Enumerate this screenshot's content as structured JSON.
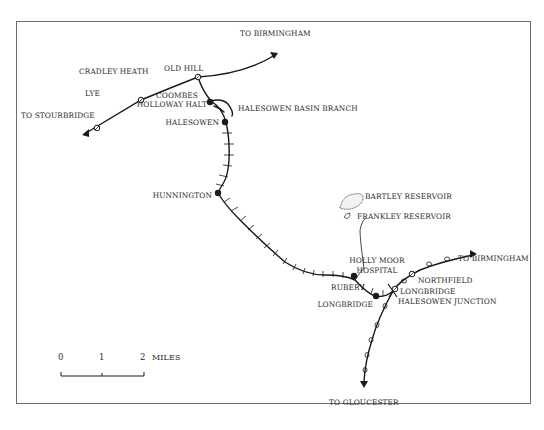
{
  "map": {
    "title": "Halesowen Railway route map",
    "colors": {
      "line": "#1a1a1a",
      "frame": "#6e6e6e",
      "text": "#2a2a2a",
      "background": "#ffffff"
    },
    "directions": {
      "to_birmingham_north": "TO BIRMINGHAM",
      "to_stourbridge": "TO STOURBRIDGE",
      "to_birmingham_east": "TO BIRMINGHAM",
      "to_gloucester": "TO GLOUCESTER"
    },
    "stations": {
      "lye": "LYE",
      "cradley_heath": "CRADLEY HEATH",
      "old_hill": "OLD HILL",
      "coombes_line1": "COOMBES",
      "coombes_line2": "HOLLOWAY HALT",
      "halesowen": "HALESOWEN",
      "hunnington": "HUNNINGTON",
      "rubery": "RUBERY",
      "longbridge": "LONGBRIDGE",
      "northfield": "NORTHFIELD",
      "longbridge_jn_line1": "LONGBRIDGE",
      "longbridge_jn_line2": "HALESOWEN JUNCTION"
    },
    "features": {
      "basin_branch": "HALESOWEN BASIN BRANCH",
      "bartley_reservoir": "BARTLEY RESERVOIR",
      "frankley_reservoir": "FRANKLEY RESERVOIR",
      "hospital_line1": "HOLLY MOOR",
      "hospital_line2": "HOSPITAL"
    },
    "scale_bar": {
      "ticks": [
        "0",
        "1",
        "2"
      ],
      "unit": "MILES"
    }
  }
}
